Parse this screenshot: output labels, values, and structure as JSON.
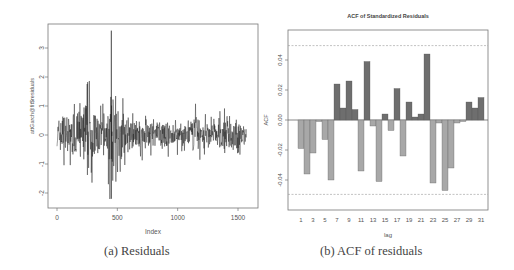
{
  "figure": {
    "panel_a": {
      "caption": "(a) Residuals"
    },
    "panel_b": {
      "caption": "(b) ACF of residuals"
    }
  },
  "chart_data": [
    {
      "type": "line",
      "title": "",
      "xlabel": "Index",
      "ylabel": "attGarch@fit$residuals",
      "xlim": [
        0,
        1580
      ],
      "ylim": [
        -2.3,
        3.6
      ],
      "x_ticks": [
        0,
        500,
        1000,
        1500
      ],
      "y_ticks": [
        -2,
        -1,
        0,
        1,
        2,
        3
      ],
      "grid": false,
      "description": "Residual time series of ~1570 observations; volatility cluster around index 200-550 with spike to ~3.6 near index 450 and trough ~-2.25; calmer afterward with occasional spikes near 1150, 1330, 1500.",
      "envelope": {
        "x": [
          0,
          50,
          100,
          150,
          200,
          250,
          300,
          350,
          400,
          440,
          450,
          470,
          500,
          550,
          600,
          700,
          800,
          900,
          1000,
          1100,
          1150,
          1200,
          1300,
          1340,
          1400,
          1450,
          1500,
          1560
        ],
        "max": [
          1.3,
          1.0,
          0.9,
          1.4,
          1.1,
          2.3,
          1.4,
          1.3,
          1.0,
          1.4,
          3.6,
          2.9,
          1.7,
          1.6,
          0.8,
          0.7,
          0.6,
          0.6,
          0.5,
          0.6,
          1.1,
          0.8,
          0.6,
          1.1,
          1.0,
          0.7,
          1.3,
          0.4
        ],
        "min": [
          -0.5,
          -1.35,
          -1.0,
          -1.2,
          -1.8,
          -2.25,
          -2.0,
          -1.3,
          -1.4,
          -2.25,
          -2.2,
          -2.0,
          -1.4,
          -1.2,
          -0.9,
          -0.9,
          -0.8,
          -0.8,
          -0.7,
          -0.6,
          -1.25,
          -0.8,
          -0.7,
          -0.8,
          -0.9,
          -0.9,
          -1.0,
          -0.4
        ]
      }
    },
    {
      "type": "bar",
      "title": "ACF of Standardized Residuals",
      "xlabel": "lag",
      "ylabel": "ACF",
      "ylim": [
        -0.054,
        0.056
      ],
      "y_ticks": [
        -0.04,
        -0.02,
        0.0,
        0.02,
        0.04
      ],
      "y_tick_labels": [
        "-0.04",
        "-0.02",
        "0.00",
        "0.02",
        "0.04"
      ],
      "x_tick_labels": [
        "1",
        "3",
        "5",
        "7",
        "9",
        "11",
        "13",
        "15",
        "17",
        "19",
        "21",
        "23",
        "25",
        "27",
        "29",
        "31"
      ],
      "confidence_bounds": [
        -0.0496,
        0.0496
      ],
      "positive_color": "#6e6e6e",
      "negative_color": "#a8a8a8",
      "categories": [
        1,
        2,
        3,
        4,
        5,
        6,
        7,
        8,
        9,
        10,
        11,
        12,
        13,
        14,
        15,
        16,
        17,
        18,
        19,
        20,
        21,
        22,
        23,
        24,
        25,
        26,
        27,
        28,
        29,
        30,
        31
      ],
      "values": [
        -0.019,
        -0.036,
        -0.022,
        -0.001,
        -0.013,
        -0.04,
        0.024,
        0.008,
        0.026,
        0.007,
        -0.034,
        0.039,
        -0.004,
        -0.041,
        0.004,
        -0.007,
        0.021,
        -0.024,
        0.012,
        0.002,
        0.004,
        0.044,
        -0.042,
        -0.002,
        -0.047,
        -0.032,
        -0.002,
        -0.001,
        0.012,
        0.008,
        0.015
      ]
    }
  ]
}
